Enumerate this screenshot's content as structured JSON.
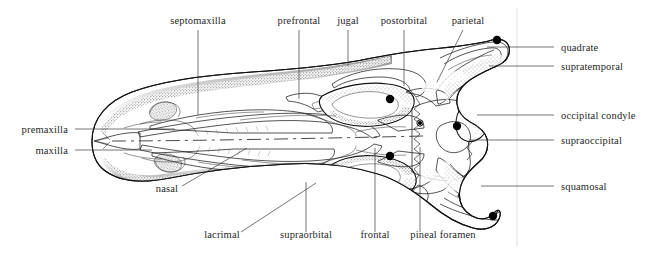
{
  "figure": {
    "view": "dorsal",
    "background_color": "#ffffff",
    "ink_color": "#121212",
    "leader_color": "#3a3a3a"
  },
  "labels": {
    "septomaxilla": "septomaxilla",
    "prefrontal": "prefrontal",
    "jugal": "jugal",
    "postorbital": "postorbital",
    "parietal": "parietal",
    "quadrate": "quadrate",
    "supratemporal": "supratemporal",
    "occipital_condyle": "occipital condyle",
    "supraoccipital": "supraoccipital",
    "squamosal": "squamosal",
    "premaxilla": "premaxilla",
    "maxilla": "maxilla",
    "nasal": "nasal",
    "lacrimal": "lacrimal",
    "supraorbital": "supraorbital",
    "frontal": "frontal",
    "pineal_foramen": "pineal foramen"
  },
  "annotations": [
    {
      "key": "septomaxilla",
      "text": "septomaxilla",
      "side": "top",
      "text_x": 198,
      "text_y": 24,
      "anchor": "middle",
      "leader": "vertical",
      "x1": 198,
      "y1": 30,
      "x2": 198,
      "y2": 115
    },
    {
      "key": "prefrontal",
      "text": "prefrontal",
      "side": "top",
      "text_x": 299,
      "text_y": 24,
      "anchor": "middle",
      "leader": "vertical",
      "x1": 299,
      "y1": 30,
      "x2": 299,
      "y2": 99
    },
    {
      "key": "jugal",
      "text": "jugal",
      "side": "top",
      "text_x": 348,
      "text_y": 24,
      "anchor": "middle",
      "leader": "vertical",
      "x1": 348,
      "y1": 30,
      "x2": 348,
      "y2": 66
    },
    {
      "key": "postorbital",
      "text": "postorbital",
      "side": "top",
      "text_x": 404,
      "text_y": 24,
      "anchor": "middle",
      "leader": "vertical",
      "x1": 404,
      "y1": 30,
      "x2": 404,
      "y2": 86
    },
    {
      "key": "parietal",
      "text": "parietal",
      "side": "top",
      "text_x": 468,
      "text_y": 24,
      "anchor": "middle",
      "leader": "diagonal",
      "x1": 463,
      "y1": 30,
      "x2": 437,
      "y2": 82
    },
    {
      "key": "quadrate",
      "text": "quadrate",
      "side": "right",
      "text_x": 561,
      "text_y": 51,
      "anchor": "start",
      "leader": "horizontal",
      "x1": 554,
      "y1": 47,
      "x2": 487,
      "y2": 47
    },
    {
      "key": "supratemporal",
      "text": "supratemporal",
      "side": "right",
      "text_x": 561,
      "text_y": 70,
      "anchor": "start",
      "leader": "horizontal",
      "x1": 554,
      "y1": 66,
      "x2": 489,
      "y2": 66
    },
    {
      "key": "occipital_condyle",
      "text": "occipital condyle",
      "side": "right",
      "text_x": 561,
      "text_y": 119,
      "anchor": "start",
      "leader": "horizontal",
      "x1": 554,
      "y1": 115,
      "x2": 477,
      "y2": 115
    },
    {
      "key": "supraoccipital",
      "text": "supraoccipital",
      "side": "right",
      "text_x": 561,
      "text_y": 144,
      "anchor": "start",
      "leader": "horizontal",
      "x1": 554,
      "y1": 140,
      "x2": 469,
      "y2": 140
    },
    {
      "key": "squamosal",
      "text": "squamosal",
      "side": "right",
      "text_x": 561,
      "text_y": 190,
      "anchor": "start",
      "leader": "horizontal",
      "x1": 554,
      "y1": 186,
      "x2": 481,
      "y2": 186
    },
    {
      "key": "premaxilla",
      "text": "premaxilla",
      "side": "left",
      "text_x": 68,
      "text_y": 133,
      "anchor": "end",
      "leader": "horizontal",
      "x1": 75,
      "y1": 129,
      "x2": 175,
      "y2": 129
    },
    {
      "key": "maxilla",
      "text": "maxilla",
      "side": "left",
      "text_x": 68,
      "text_y": 154,
      "anchor": "end",
      "leader": "horizontal",
      "x1": 75,
      "y1": 150,
      "x2": 152,
      "y2": 150
    },
    {
      "key": "nasal",
      "text": "nasal",
      "side": "bottom",
      "text_x": 167,
      "text_y": 192,
      "anchor": "middle",
      "leader": "diagonal",
      "x1": 182,
      "y1": 186,
      "x2": 247,
      "y2": 148
    },
    {
      "key": "lacrimal",
      "text": "lacrimal",
      "side": "bottom",
      "text_x": 222,
      "text_y": 238,
      "anchor": "middle",
      "leader": "diagonal",
      "x1": 241,
      "y1": 232,
      "x2": 316,
      "y2": 183
    },
    {
      "key": "supraorbital",
      "text": "supraorbital",
      "side": "bottom",
      "text_x": 306,
      "text_y": 238,
      "anchor": "middle",
      "leader": "vertical",
      "x1": 306,
      "y1": 232,
      "x2": 306,
      "y2": 182
    },
    {
      "key": "frontal",
      "text": "frontal",
      "side": "bottom",
      "text_x": 375,
      "text_y": 238,
      "anchor": "middle",
      "leader": "vertical",
      "x1": 375,
      "y1": 232,
      "x2": 375,
      "y2": 148
    },
    {
      "key": "pineal_foramen",
      "text": "pineal foramen",
      "side": "bottom",
      "text_x": 443,
      "text_y": 238,
      "anchor": "middle",
      "leader": "vertical",
      "x1": 420,
      "y1": 232,
      "x2": 420,
      "y2": 147
    }
  ],
  "dots": [
    {
      "name": "parietal-dot",
      "x": 497,
      "y": 40,
      "r": 4.2
    },
    {
      "name": "postorbital-dot",
      "x": 390,
      "y": 99,
      "r": 4.2
    },
    {
      "name": "occipital-condyle-dot",
      "x": 457,
      "y": 126,
      "r": 4.2
    },
    {
      "name": "frontal-dot",
      "x": 390,
      "y": 156,
      "r": 4.2
    },
    {
      "name": "squamosal-dot",
      "x": 493,
      "y": 216,
      "r": 4.2
    },
    {
      "name": "pineal-foramen-dot",
      "x": 420,
      "y": 123,
      "r": 2.1
    }
  ],
  "guides": [
    {
      "name": "vertical-guide-right",
      "x1": 517,
      "y1": 8,
      "x2": 517,
      "y2": 246
    }
  ]
}
